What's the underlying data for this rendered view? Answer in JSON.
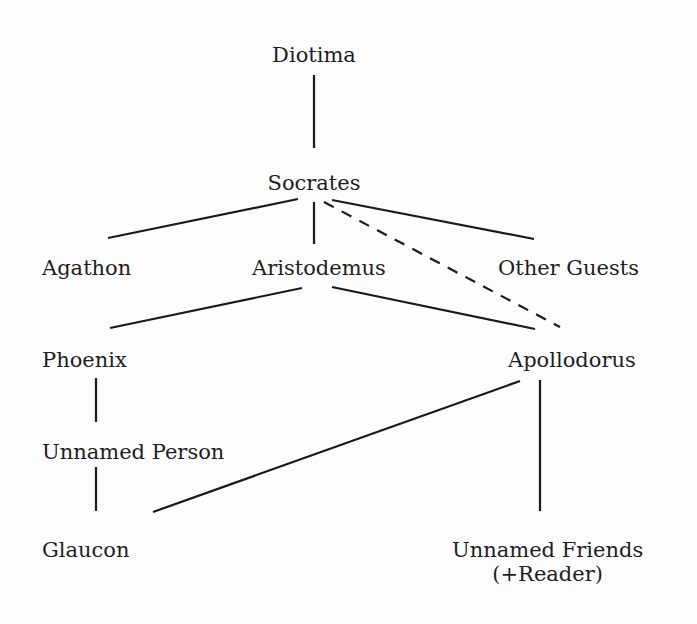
{
  "diagram": {
    "type": "narrative transmission tree",
    "nodes": {
      "diotima": "Diotima",
      "socrates": "Socrates",
      "agathon": "Agathon",
      "aristodemus": "Aristodemus",
      "other_guests": "Other Guests",
      "phoenix": "Phoenix",
      "apollodorus": "Apollodorus",
      "unnamed_person": "Unnamed Person",
      "glaucon": "Glaucon",
      "unnamed_friends": "Unnamed Friends",
      "unnamed_friends_sub": "(+Reader)"
    },
    "edges": [
      {
        "from": "Diotima",
        "to": "Socrates",
        "style": "solid"
      },
      {
        "from": "Socrates",
        "to": "Agathon",
        "style": "solid"
      },
      {
        "from": "Socrates",
        "to": "Aristodemus",
        "style": "solid"
      },
      {
        "from": "Socrates",
        "to": "Other Guests",
        "style": "solid"
      },
      {
        "from": "Socrates",
        "to": "Apollodorus",
        "style": "dashed"
      },
      {
        "from": "Aristodemus",
        "to": "Phoenix",
        "style": "solid"
      },
      {
        "from": "Aristodemus",
        "to": "Apollodorus",
        "style": "solid"
      },
      {
        "from": "Phoenix",
        "to": "Unnamed Person",
        "style": "solid"
      },
      {
        "from": "Unnamed Person",
        "to": "Glaucon",
        "style": "solid"
      },
      {
        "from": "Apollodorus",
        "to": "Glaucon",
        "style": "solid"
      },
      {
        "from": "Apollodorus",
        "to": "Unnamed Friends (+Reader)",
        "style": "solid"
      }
    ]
  }
}
